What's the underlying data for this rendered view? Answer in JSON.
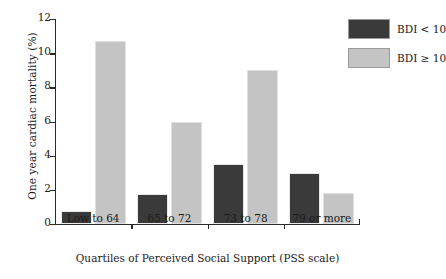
{
  "chart_data": {
    "type": "bar",
    "title": "",
    "categories": [
      "Low to 64",
      "65 to 72",
      "73 to 78",
      "79 or more"
    ],
    "series": [
      {
        "name": "BDI < 10",
        "color": "#3a3a3a",
        "values": [
          0.75,
          1.75,
          3.5,
          3.0
        ]
      },
      {
        "name": "BDI ≥ 10",
        "color": "#c4c4c4",
        "values": [
          10.7,
          6.0,
          9.0,
          1.8
        ]
      }
    ],
    "xlabel": "Quartiles of Perceived Social Support (PSS scale)",
    "ylabel": "One year cardiac mortality (%)",
    "ylim": [
      0,
      12
    ],
    "yticks": [
      "0",
      "2",
      "4",
      "6",
      "8",
      "10",
      "12"
    ],
    "ytick_values": [
      0,
      2,
      4,
      6,
      8,
      10,
      12
    ],
    "grid": false,
    "legend_position": "top-right",
    "bar_mode": "grouped"
  },
  "legend": {
    "items": [
      {
        "label": "BDI < 10",
        "swatch": "dark-swatch"
      },
      {
        "label": "BDI ≥ 10",
        "swatch": "light-swatch"
      }
    ]
  }
}
